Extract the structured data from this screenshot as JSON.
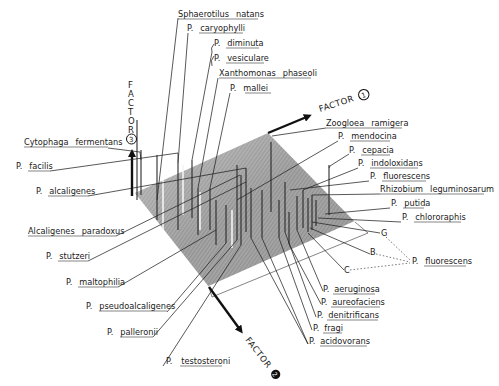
{
  "figure": {
    "type": "3d-factor-plot",
    "plane_color": "#9a9a9a",
    "plane_highlight": "#c8c8c8",
    "ink_color": "#1a1a1a"
  },
  "axes": {
    "factor1": {
      "label": "FACTOR",
      "number": "1"
    },
    "factor2": {
      "label": "FACTOR",
      "number": "2"
    },
    "factor3": {
      "label": "FACTOR",
      "number": "3"
    }
  },
  "labels_top": [
    {
      "genus": "Sphaerotilus",
      "species": "natans"
    },
    {
      "genus": "P.",
      "species": "caryophylli"
    },
    {
      "genus": "P.",
      "species": "diminuta"
    },
    {
      "genus": "P.",
      "species": "vesiculare"
    },
    {
      "genus": "Xanthomonas",
      "species": "phaseoli"
    },
    {
      "genus": "P.",
      "species": "mallei"
    }
  ],
  "labels_left": [
    {
      "genus": "Cytophaga",
      "species": "fermentans"
    },
    {
      "genus": "P.",
      "species": "facilis"
    },
    {
      "genus": "P.",
      "species": "alcaligenes"
    },
    {
      "genus": "Alcaligenes",
      "species": "paradoxus"
    },
    {
      "genus": "P.",
      "species": "stutzeri"
    },
    {
      "genus": "P.",
      "species": "maltophilia"
    },
    {
      "genus": "P.",
      "species": "pseudoalcaligenes"
    },
    {
      "genus": "P.",
      "species": "palleronii"
    },
    {
      "genus": "P.",
      "species": "testosteroni"
    }
  ],
  "labels_right": [
    {
      "genus": "Zoogloea",
      "species": "ramigera"
    },
    {
      "genus": "P.",
      "species": "mendocina"
    },
    {
      "genus": "P.",
      "species": "cepacia"
    },
    {
      "genus": "P.",
      "species": "indoloxidans"
    },
    {
      "genus": "P.",
      "species": "fluorescens"
    },
    {
      "genus": "Rhizobium",
      "species": "leguminosarum"
    },
    {
      "genus": "P.",
      "species": "putida"
    },
    {
      "genus": "P.",
      "species": "chlororaphis"
    }
  ],
  "biotype_group": {
    "biotypes": [
      "G",
      "B",
      "C"
    ],
    "genus": "P.",
    "species": "fluorescens"
  },
  "labels_bottom_right": [
    {
      "genus": "P.",
      "species": "aeruginosa"
    },
    {
      "genus": "P.",
      "species": "aureofaciens"
    },
    {
      "genus": "P.",
      "species": "denitrificans"
    },
    {
      "genus": "P.",
      "species": "fragi"
    },
    {
      "genus": "P.",
      "species": "acidovorans"
    }
  ]
}
